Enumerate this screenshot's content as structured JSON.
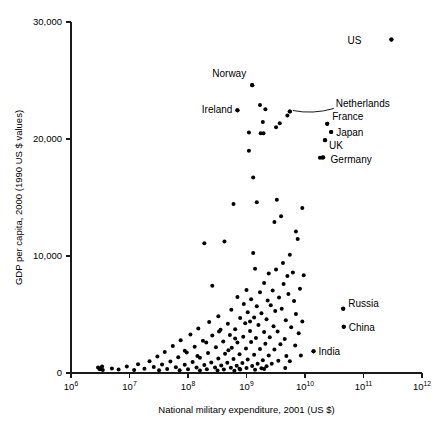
{
  "chart_data": {
    "type": "scatter",
    "title": "",
    "xlabel": "National military expenditure, 2001 (US $)",
    "ylabel": "GDP per capita, 2000 (1990 US $ values)",
    "xscale": "log",
    "yscale": "linear",
    "xlim": [
      1000000,
      1000000000000
    ],
    "ylim": [
      0,
      30000
    ],
    "grid": false,
    "legend": "none",
    "xticks": [
      {
        "value": 1000000,
        "label": "10",
        "exponent": "6"
      },
      {
        "value": 10000000,
        "label": "10",
        "exponent": "7"
      },
      {
        "value": 100000000,
        "label": "10",
        "exponent": "8"
      },
      {
        "value": 1000000000,
        "label": "10",
        "exponent": "9"
      },
      {
        "value": 10000000000,
        "label": "10",
        "exponent": "10"
      },
      {
        "value": 100000000000,
        "label": "10",
        "exponent": "11"
      },
      {
        "value": 1000000000000,
        "label": "10",
        "exponent": "12"
      }
    ],
    "yticks": [
      {
        "value": 0,
        "label": "0"
      },
      {
        "value": 10000,
        "label": "10,000"
      },
      {
        "value": 20000,
        "label": "20,000"
      },
      {
        "value": 30000,
        "label": "30,000"
      }
    ],
    "annotations": [
      {
        "label": "US",
        "x": 300000000000,
        "y": 28500,
        "text_dx": -30,
        "text_dy": 4,
        "anchor": "end",
        "leader": false
      },
      {
        "label": "Norway",
        "x": 1250000000,
        "y": 24600,
        "text_dx": -6,
        "text_dy": -8,
        "anchor": "end",
        "leader": false
      },
      {
        "label": "Ireland",
        "x": 700000000,
        "y": 22450,
        "text_dx": -5,
        "text_dy": 3,
        "anchor": "end",
        "leader": false
      },
      {
        "label": "Netherlands",
        "x": 5500000000,
        "y": 22350,
        "text_dx": 46,
        "text_dy": -5,
        "anchor": "start",
        "leader": true
      },
      {
        "label": "France",
        "x": 24000000000,
        "y": 21300,
        "text_dx": 5,
        "text_dy": -4,
        "anchor": "start",
        "leader": false
      },
      {
        "label": "Japan",
        "x": 28000000000,
        "y": 20600,
        "text_dx": 5,
        "text_dy": 4,
        "anchor": "start",
        "leader": false
      },
      {
        "label": "UK",
        "x": 22000000000,
        "y": 19900,
        "text_dx": 4,
        "text_dy": 9,
        "anchor": "start",
        "leader": false
      },
      {
        "label": "Germany",
        "x": 20000000000,
        "y": 18400,
        "text_dx": 8,
        "text_dy": 5,
        "anchor": "start",
        "leader": false
      },
      {
        "label": "Russia",
        "x": 45000000000,
        "y": 5500,
        "text_dx": 5,
        "text_dy": -2,
        "anchor": "start",
        "leader": false
      },
      {
        "label": "China",
        "x": 46000000000,
        "y": 3950,
        "text_dx": 5,
        "text_dy": 4,
        "anchor": "start",
        "leader": false
      },
      {
        "label": "India",
        "x": 14000000000,
        "y": 1850,
        "text_dx": 5,
        "text_dy": 4,
        "anchor": "start",
        "leader": false
      }
    ],
    "points": [
      [
        300000000000,
        28500
      ],
      [
        1250000000,
        24600
      ],
      [
        700000000,
        22450
      ],
      [
        1700000000,
        22900
      ],
      [
        2100000000,
        22550
      ],
      [
        5500000000,
        22350
      ],
      [
        5000000000,
        22000
      ],
      [
        24000000000,
        21300
      ],
      [
        28000000000,
        20600
      ],
      [
        22000000000,
        19900
      ],
      [
        1900000000,
        21450
      ],
      [
        3700000000,
        21350
      ],
      [
        3200000000,
        21000
      ],
      [
        1100000000,
        20550
      ],
      [
        1750000000,
        20500
      ],
      [
        1950000000,
        20500
      ],
      [
        18000000000,
        18400
      ],
      [
        20500000000,
        18450
      ],
      [
        1100000000,
        19000
      ],
      [
        1300000000,
        16700
      ],
      [
        1500000000,
        14600
      ],
      [
        600000000,
        14450
      ],
      [
        3300000000,
        14800
      ],
      [
        3900000000,
        13400
      ],
      [
        9000000000,
        14100
      ],
      [
        3000000000,
        12900
      ],
      [
        7000000000,
        12100
      ],
      [
        190000000,
        11100
      ],
      [
        420000000,
        11250
      ],
      [
        7500000000,
        11450
      ],
      [
        1300000000,
        10250
      ],
      [
        5500000000,
        10100
      ],
      [
        4200000000,
        9400
      ],
      [
        1400000000,
        8900
      ],
      [
        2400000000,
        8500
      ],
      [
        3200000000,
        8850
      ],
      [
        5000000000,
        8300
      ],
      [
        6200000000,
        8600
      ],
      [
        9500000000,
        8350
      ],
      [
        260000000,
        7450
      ],
      [
        2000000000,
        7700
      ],
      [
        4300000000,
        7600
      ],
      [
        8200000000,
        7200
      ],
      [
        1000000000,
        7100
      ],
      [
        1700000000,
        6900
      ],
      [
        2800000000,
        7050
      ],
      [
        5200000000,
        6750
      ],
      [
        700000000,
        6500
      ],
      [
        1200000000,
        6300
      ],
      [
        2300000000,
        6200
      ],
      [
        3600000000,
        6450
      ],
      [
        6500000000,
        6150
      ],
      [
        900000000,
        5900
      ],
      [
        1500000000,
        5700
      ],
      [
        2600000000,
        5800
      ],
      [
        4000000000,
        5500
      ],
      [
        45000000000,
        5500
      ],
      [
        550000000,
        5400
      ],
      [
        1050000000,
        5200
      ],
      [
        1800000000,
        5100
      ],
      [
        3100000000,
        5300
      ],
      [
        7000000000,
        5050
      ],
      [
        330000000,
        4850
      ],
      [
        780000000,
        4700
      ],
      [
        1350000000,
        4750
      ],
      [
        2200000000,
        4600
      ],
      [
        4700000000,
        4500
      ],
      [
        9000000000,
        4400
      ],
      [
        230000000,
        4350
      ],
      [
        480000000,
        4200
      ],
      [
        950000000,
        4250
      ],
      [
        1600000000,
        4100
      ],
      [
        2900000000,
        4000
      ],
      [
        5800000000,
        3900
      ],
      [
        46000000000,
        3950
      ],
      [
        150000000,
        3800
      ],
      [
        360000000,
        3700
      ],
      [
        640000000,
        3750
      ],
      [
        1150000000,
        3600
      ],
      [
        2000000000,
        3500
      ],
      [
        3400000000,
        3550
      ],
      [
        7800000000,
        3400
      ],
      [
        110000000,
        3300
      ],
      [
        260000000,
        3200
      ],
      [
        520000000,
        3250
      ],
      [
        880000000,
        3100
      ],
      [
        1450000000,
        3000
      ],
      [
        2500000000,
        3050
      ],
      [
        4500000000,
        2900
      ],
      [
        75000000,
        2800
      ],
      [
        180000000,
        2750
      ],
      [
        400000000,
        2700
      ],
      [
        700000000,
        2600
      ],
      [
        1200000000,
        2650
      ],
      [
        2100000000,
        2500
      ],
      [
        3800000000,
        2450
      ],
      [
        6800000000,
        2350
      ],
      [
        55000000,
        2300
      ],
      [
        130000000,
        2250
      ],
      [
        300000000,
        2200
      ],
      [
        560000000,
        2150
      ],
      [
        980000000,
        2100
      ],
      [
        1700000000,
        2050
      ],
      [
        3000000000,
        2000
      ],
      [
        14000000000,
        1850
      ],
      [
        40000000,
        1800
      ],
      [
        95000000,
        1750
      ],
      [
        220000000,
        1700
      ],
      [
        430000000,
        1650
      ],
      [
        760000000,
        1600
      ],
      [
        1350000000,
        1550
      ],
      [
        2400000000,
        1500
      ],
      [
        4800000000,
        1450
      ],
      [
        30000000,
        1400
      ],
      [
        68000000,
        1350
      ],
      [
        160000000,
        1300
      ],
      [
        330000000,
        1250
      ],
      [
        600000000,
        1200
      ],
      [
        1050000000,
        1150
      ],
      [
        1900000000,
        1100
      ],
      [
        3500000000,
        1050
      ],
      [
        22000000,
        1000
      ],
      [
        50000000,
        980
      ],
      [
        120000000,
        950
      ],
      [
        250000000,
        900
      ],
      [
        470000000,
        880
      ],
      [
        850000000,
        850
      ],
      [
        1550000000,
        800
      ],
      [
        2700000000,
        780
      ],
      [
        14000000,
        750
      ],
      [
        36000000,
        720
      ],
      [
        88000000,
        700
      ],
      [
        190000000,
        680
      ],
      [
        370000000,
        650
      ],
      [
        680000000,
        620
      ],
      [
        1250000000,
        600
      ],
      [
        2200000000,
        580
      ],
      [
        9000000,
        550
      ],
      [
        26000000,
        520
      ],
      [
        62000000,
        500
      ],
      [
        140000000,
        480
      ],
      [
        290000000,
        460
      ],
      [
        540000000,
        440
      ],
      [
        1000000000,
        420
      ],
      [
        1800000000,
        400
      ],
      [
        5000000,
        380
      ],
      [
        18000000,
        360
      ],
      [
        44000000,
        340
      ],
      [
        100000000,
        330
      ],
      [
        210000000,
        310
      ],
      [
        410000000,
        300
      ],
      [
        780000000,
        290
      ],
      [
        1400000000,
        280
      ],
      [
        3500000,
        260
      ],
      [
        12000000,
        250
      ],
      [
        32000000,
        240
      ],
      [
        72000000,
        230
      ],
      [
        160000000,
        220
      ],
      [
        320000000,
        210
      ],
      [
        620000000,
        200
      ],
      [
        3200000,
        400
      ],
      [
        3400000,
        550
      ],
      [
        6500000,
        300
      ],
      [
        3100000,
        330
      ],
      [
        2900000,
        480
      ],
      [
        5500000000,
        1000
      ],
      [
        8500000000,
        1500
      ],
      [
        4600000000,
        420
      ],
      [
        2000000000,
        350
      ],
      [
        760000000,
        370
      ],
      [
        490000000,
        1950
      ],
      [
        145000000,
        1450
      ],
      [
        88000000,
        1900
      ],
      [
        640000000,
        2950
      ],
      [
        340000000,
        3550
      ],
      [
        205000000,
        2600
      ],
      [
        1150000000,
        4400
      ]
    ]
  }
}
